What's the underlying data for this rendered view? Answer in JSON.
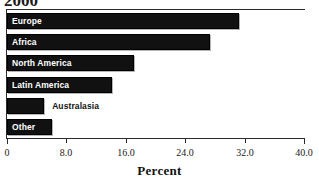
{
  "chart_data": {
    "type": "bar",
    "orientation": "horizontal",
    "title": "2000",
    "title_note": "cropped at top edge of image",
    "categories": [
      "Europe",
      "Africa",
      "North America",
      "Latin America",
      "Australasia",
      "Other"
    ],
    "values": [
      31.3,
      27.3,
      17.1,
      14.1,
      5.0,
      6.1
    ],
    "xlabel": "Percent",
    "ylabel": "",
    "xlim": [
      0,
      40
    ],
    "xticks": [
      0,
      8,
      16,
      24,
      32,
      40
    ],
    "xtick_labels": [
      "0",
      "8.0",
      "16.0",
      "24.0",
      "32.0",
      "40.0"
    ],
    "grid": false,
    "legend": false,
    "bar_color": "#111111",
    "label_color_inside": "#ffffff",
    "label_color_outside": "#121212",
    "label_placement": [
      "inside",
      "inside",
      "inside",
      "inside",
      "outside",
      "inside"
    ]
  },
  "axis": {
    "title": "Percent"
  }
}
